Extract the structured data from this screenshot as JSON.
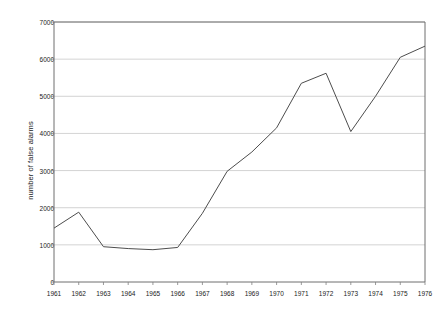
{
  "chart_data": {
    "type": "line",
    "title": "",
    "xlabel": "",
    "ylabel": "number of false alarms",
    "x": [
      1961,
      1962,
      1963,
      1964,
      1965,
      1966,
      1967,
      1968,
      1969,
      1970,
      1971,
      1972,
      1973,
      1974,
      1975,
      1976
    ],
    "categories": [
      "1961",
      "1962",
      "1963",
      "1964",
      "1965",
      "1966",
      "1967",
      "1968",
      "1969",
      "1970",
      "1971",
      "1972",
      "1973",
      "1974",
      "1975",
      "1976"
    ],
    "values": [
      1450,
      1880,
      950,
      900,
      870,
      930,
      1850,
      2980,
      3500,
      4150,
      5350,
      5620,
      4050,
      5000,
      6050,
      6350
    ],
    "series": [
      {
        "name": "number of false alarms",
        "values": [
          1450,
          1880,
          950,
          900,
          870,
          930,
          1850,
          2980,
          3500,
          4150,
          5350,
          5620,
          4050,
          5000,
          6050,
          6350
        ]
      }
    ],
    "ylim": [
      0,
      7000
    ],
    "yticks": [
      0,
      1000,
      2000,
      3000,
      4000,
      5000,
      6000,
      7000
    ],
    "ytick_labels": [
      "0",
      "1000",
      "2000",
      "3000",
      "4000",
      "5000",
      "6000",
      "7000"
    ],
    "xlim": [
      1961,
      1976
    ],
    "xticks": [
      1961,
      1962,
      1963,
      1964,
      1965,
      1966,
      1967,
      1968,
      1969,
      1970,
      1971,
      1972,
      1973,
      1974,
      1975,
      1976
    ],
    "grid": "horizontal",
    "legend": "none",
    "line_color": "#4d4d4d",
    "gridline_color": "#c8c8c8",
    "axis_color": "#808080",
    "background_color": "#ffffff"
  },
  "plot_geometry": {
    "left": 54,
    "right": 425,
    "top": 22,
    "bottom": 282
  }
}
